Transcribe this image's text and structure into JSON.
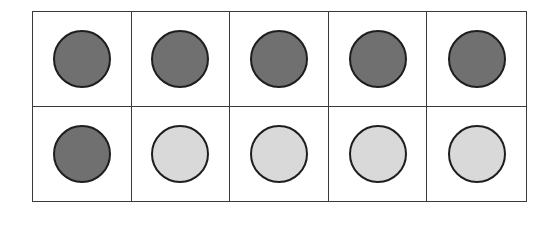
{
  "ten_frame": {
    "rows": 2,
    "columns": 5,
    "colors": {
      "filled": "#707070",
      "empty": "#d9d9d9",
      "outline": "#1e1e1e",
      "grid": "#3a3a3a"
    },
    "cells": [
      {
        "state": "filled"
      },
      {
        "state": "filled"
      },
      {
        "state": "filled"
      },
      {
        "state": "filled"
      },
      {
        "state": "filled"
      },
      {
        "state": "filled"
      },
      {
        "state": "empty"
      },
      {
        "state": "empty"
      },
      {
        "state": "empty"
      },
      {
        "state": "empty"
      }
    ],
    "filled_count": 6,
    "empty_count": 4
  }
}
